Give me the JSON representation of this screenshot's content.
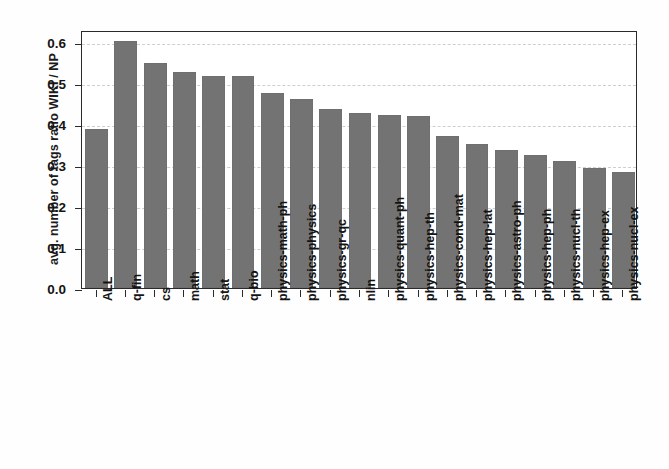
{
  "chart_data": {
    "type": "bar",
    "title": "",
    "xlabel": "",
    "ylabel": "avg. number of tags ratio WIKI / NP",
    "ylim": [
      0.0,
      0.63
    ],
    "yticks": [
      "0.0",
      "0.1",
      "0.2",
      "0.3",
      "0.4",
      "0.5",
      "0.6"
    ],
    "ytick_values": [
      0.0,
      0.1,
      0.2,
      0.3,
      0.4,
      0.5,
      0.6
    ],
    "grid": "horizontal dashed light-gray",
    "legend": "none",
    "bar_color": "#737373",
    "categories": [
      "ALL",
      "q-fin",
      "cs",
      "math",
      "stat",
      "q-bio",
      "physics-math-ph",
      "physics-physics",
      "physics-gr-qc",
      "nlin",
      "physics-quant-ph",
      "physics-hep-th",
      "physics-cond-mat",
      "physics-hep-lat",
      "physics-astro-ph",
      "physics-hep-ph",
      "physics-nucl-th",
      "physics-hep-ex",
      "physics-nucl-ex"
    ],
    "values": [
      0.388,
      0.602,
      0.549,
      0.528,
      0.518,
      0.517,
      0.476,
      0.461,
      0.437,
      0.428,
      0.422,
      0.421,
      0.372,
      0.352,
      0.338,
      0.324,
      0.311,
      0.293,
      0.283
    ]
  }
}
